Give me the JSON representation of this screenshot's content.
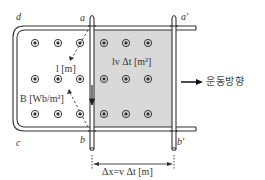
{
  "diagram": {
    "type": "moving-conductor-on-rails",
    "colors": {
      "line": "#333333",
      "shaded_area": "#d9d9d9",
      "background": "#ffffff"
    },
    "corner_labels": {
      "d": "d",
      "a": "a",
      "a_prime": "a′",
      "c": "c",
      "b": "b",
      "b_prime": "b′"
    },
    "length_label": "l [m]",
    "field_label": "B [Wb/m²]",
    "area_label": "lv Δt [m²]",
    "displacement_label": "Δx=v Δt [m]",
    "motion_direction_label": "운동방향",
    "field_symbol": "dot-out-of-page",
    "field_grid": {
      "rows": 3,
      "columns": 6
    }
  }
}
